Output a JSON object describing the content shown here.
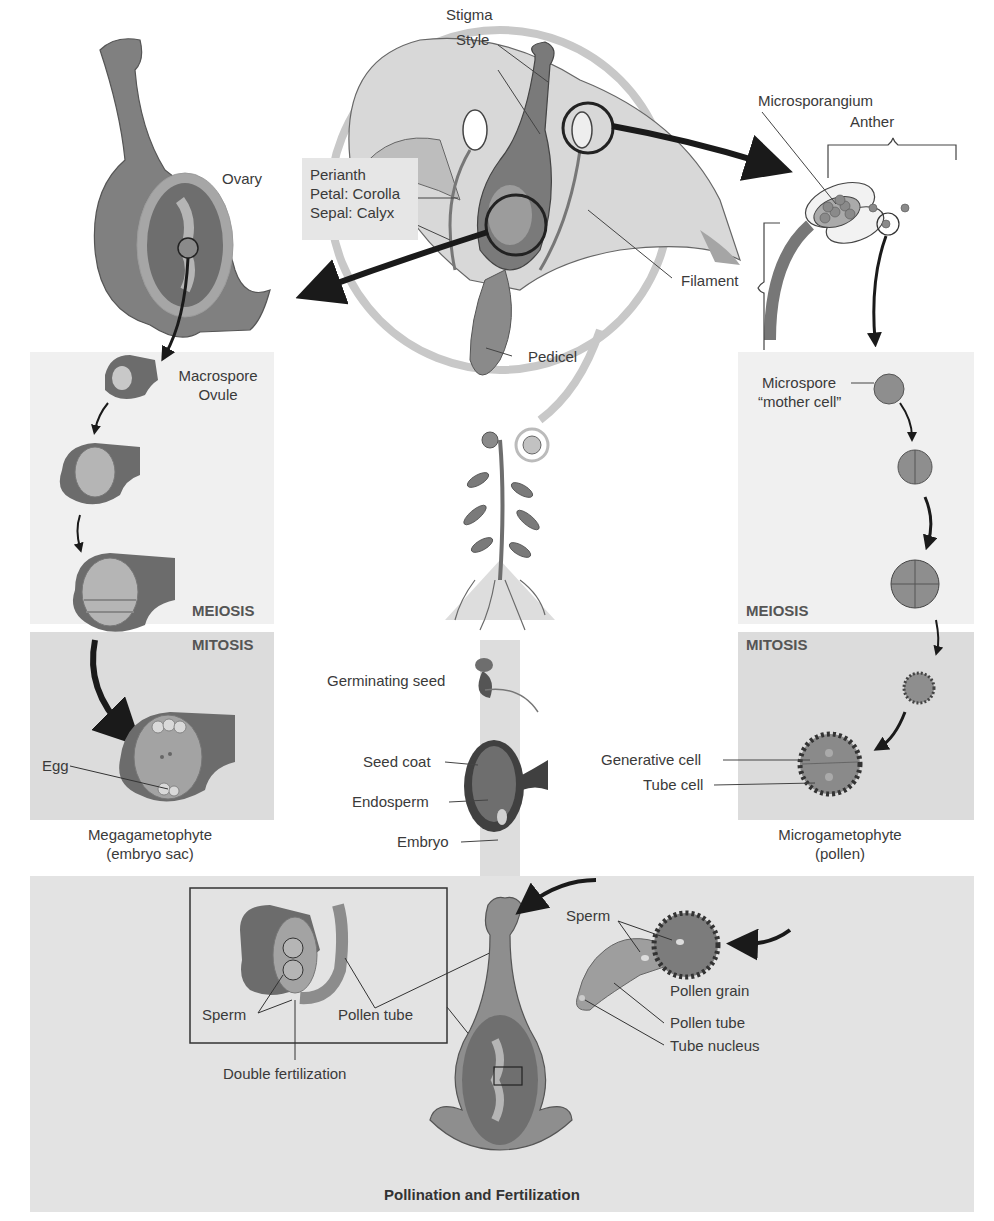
{
  "diagram": {
    "colors": {
      "background": "#ffffff",
      "light_panel": "#efefef",
      "mid_panel": "#dcdcdc",
      "bottom_panel": "#e2e2e2",
      "tissue_dark": "#6e6e6e",
      "tissue_mid": "#8c8c8c",
      "tissue_light": "#b8b8b8",
      "arrow": "#1a1a1a"
    },
    "flower": {
      "stigma": "Stigma",
      "style": "Style",
      "perianth_box": {
        "line1": "Perianth",
        "line2": "Petal: Corolla",
        "line3": "Sepal: Calyx"
      },
      "filament": "Filament",
      "pedicel": "Pedicel"
    },
    "anther_detail": {
      "microsporangium": "Microsporangium",
      "anther": "Anther"
    },
    "female_side": {
      "ovary": "Ovary",
      "macrospore_line1": "Macrospore",
      "macrospore_line2": "Ovule",
      "meiosis": "MEIOSIS",
      "mitosis": "MITOSIS",
      "egg": "Egg",
      "megagametophyte_line1": "Megagametophyte",
      "megagametophyte_line2": "(embryo sac)"
    },
    "male_side": {
      "microspore_line1": "Microspore",
      "microspore_line2": "“mother cell”",
      "meiosis": "MEIOSIS",
      "mitosis": "MITOSIS",
      "generative_cell": "Generative cell",
      "tube_cell": "Tube cell",
      "microgametophyte_line1": "Microgametophyte",
      "microgametophyte_line2": "(pollen)"
    },
    "center": {
      "germinating_seed": "Germinating seed",
      "seed_coat": "Seed coat",
      "endosperm": "Endosperm",
      "embryo": "Embryo"
    },
    "pollination": {
      "title": "Pollination and Fertilization",
      "inset_sperm": "Sperm",
      "inset_pollen_tube": "Pollen tube",
      "double_fertilization": "Double fertilization",
      "grain_sperm": "Sperm",
      "pollen_grain": "Pollen grain",
      "pollen_tube": "Pollen tube",
      "tube_nucleus": "Tube nucleus"
    }
  }
}
